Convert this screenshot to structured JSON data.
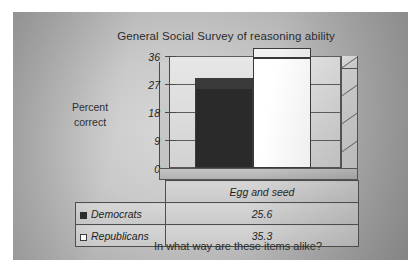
{
  "chart_data": {
    "type": "bar",
    "title": "General Social Survey of reasoning ability",
    "categories": [
      "Egg and seed"
    ],
    "series": [
      {
        "name": "Democrats",
        "values": [
          25.6
        ],
        "color": "#2a2a2a",
        "swatch": "filled-square"
      },
      {
        "name": "Republicans",
        "values": [
          35.3
        ],
        "color": "#ffffff",
        "swatch": "open-square"
      }
    ],
    "xlabel": "",
    "ylabel": "Percent correct",
    "ylim": [
      0,
      36
    ],
    "yticks": [
      0,
      9,
      18,
      27,
      36
    ],
    "ytick_labels": [
      "0",
      "9",
      "18",
      "27",
      "36"
    ],
    "grid": true,
    "legend_position": "data-table-below",
    "annotation": "In what way are these items alike?",
    "style": "3d-perspective-bar"
  },
  "axis_title": {
    "line1": "Percent",
    "line2": "correct"
  },
  "table": {
    "category_header": "Egg and seed",
    "rows": [
      {
        "key": "Democrats",
        "value": "25.6"
      },
      {
        "key": "Republicans",
        "value": "35.3"
      }
    ]
  },
  "caption": "In what way are these items alike?",
  "colors": {
    "democrat_bar": "#2a2a2a",
    "republican_bar": "#ffffff",
    "plot_border": "#555555",
    "gridline": "#5d5d5d",
    "text": "#2b2b2b"
  }
}
